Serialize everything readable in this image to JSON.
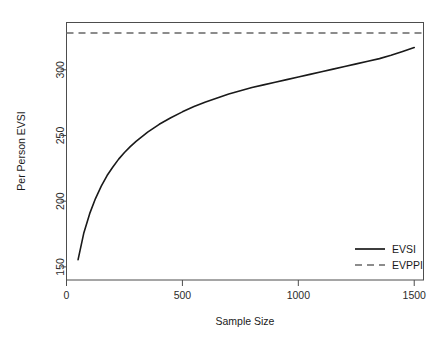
{
  "chart_data": {
    "type": "line",
    "title": "",
    "xlabel": "Sample Size",
    "ylabel": "Per Person EVSI",
    "xlim": [
      0,
      1540
    ],
    "ylim": [
      140,
      336
    ],
    "xticks": [
      0,
      500,
      1000,
      1500
    ],
    "xtick_labels": [
      "0",
      "500",
      "1000",
      "1500"
    ],
    "yticks": [
      150,
      200,
      250,
      300
    ],
    "ytick_labels": [
      "150",
      "200",
      "250",
      "300"
    ],
    "grid": false,
    "legend_position": "bottom-right",
    "series": [
      {
        "name": "EVSI",
        "style": "solid",
        "color": "#1a1a1a",
        "x": [
          50,
          75,
          100,
          125,
          150,
          175,
          200,
          225,
          250,
          275,
          300,
          350,
          400,
          450,
          500,
          550,
          600,
          650,
          700,
          750,
          800,
          850,
          900,
          950,
          1000,
          1050,
          1100,
          1150,
          1200,
          1250,
          1300,
          1350,
          1400,
          1450,
          1500
        ],
        "values": [
          155.5,
          176.0,
          190.5,
          202.0,
          211.5,
          219.5,
          226.0,
          232.0,
          237.0,
          241.5,
          245.5,
          252.5,
          258.5,
          263.5,
          268.0,
          272.0,
          275.5,
          278.5,
          281.5,
          284.0,
          286.5,
          288.5,
          290.5,
          292.5,
          294.5,
          296.5,
          298.5,
          300.5,
          302.5,
          304.5,
          306.5,
          308.5,
          311.0,
          314.0,
          317.0
        ]
      },
      {
        "name": "EVPPI",
        "style": "dashed",
        "color": "#8c8c8c",
        "constant_value": 328.0
      }
    ]
  },
  "legend": {
    "entries": [
      {
        "label": "EVSI",
        "style": "solid",
        "color": "#1a1a1a"
      },
      {
        "label": "EVPPI",
        "style": "dashed",
        "color": "#8c8c8c"
      }
    ]
  },
  "colors": {
    "evsi_line": "#1a1a1a",
    "evppi_line": "#8c8c8c",
    "axis": "#4d4d4d",
    "frame": "#4d4d4d",
    "background": "#ffffff"
  }
}
